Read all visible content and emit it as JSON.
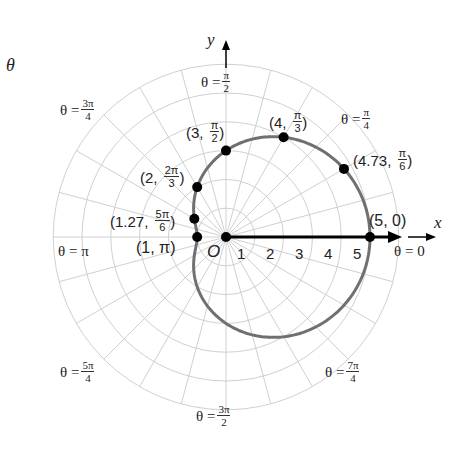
{
  "corner_label": "θ",
  "axes": {
    "x_label": "x",
    "y_label": "y",
    "origin_label": "O",
    "ticks": [
      "1",
      "2",
      "3",
      "4",
      "5"
    ]
  },
  "angle_labels": [
    {
      "prefix": "θ =",
      "num": "π",
      "den": "2"
    },
    {
      "prefix": "θ =",
      "num": "3π",
      "den": "4"
    },
    {
      "prefix": "θ =",
      "num": "π",
      "den": "4"
    },
    {
      "prefix": "θ = π"
    },
    {
      "prefix": "θ = 0"
    },
    {
      "prefix": "θ =",
      "num": "5π",
      "den": "4"
    },
    {
      "prefix": "θ =",
      "num": "7π",
      "den": "4"
    },
    {
      "prefix": "θ =",
      "num": "3π",
      "den": "2"
    }
  ],
  "points": [
    {
      "r": "3",
      "num": "π",
      "den": "2"
    },
    {
      "r": "4",
      "num": "π",
      "den": "3"
    },
    {
      "r": "4.73",
      "num": "π",
      "den": "6"
    },
    {
      "r": "2",
      "num": "2π",
      "den": "3"
    },
    {
      "r": "1.27",
      "num": "5π",
      "den": "6"
    },
    {
      "text": "(1, π)"
    },
    {
      "text": "(5, 0)"
    }
  ],
  "chart_data": {
    "type": "polar-curve",
    "equation": "r = 3 + 2cos(θ)",
    "curve": "limaçon (dimpled)",
    "grid": {
      "rings": [
        1,
        2,
        3,
        4,
        5,
        6
      ],
      "spoke_step": "π/12"
    },
    "plotted_points": [
      {
        "r": 5,
        "theta": "0"
      },
      {
        "r": 4.73,
        "theta": "π/6"
      },
      {
        "r": 4,
        "theta": "π/3"
      },
      {
        "r": 3,
        "theta": "π/2"
      },
      {
        "r": 2,
        "theta": "2π/3"
      },
      {
        "r": 1.27,
        "theta": "5π/6"
      },
      {
        "r": 1,
        "theta": "π"
      }
    ],
    "x_ticks": [
      1,
      2,
      3,
      4,
      5
    ],
    "angle_labels": [
      "0",
      "π/4",
      "π/2",
      "3π/4",
      "π",
      "5π/4",
      "3π/2",
      "7π/4"
    ],
    "colors": {
      "curve": "#707070",
      "grid": "#cfcfcf",
      "points": "#000000"
    }
  }
}
